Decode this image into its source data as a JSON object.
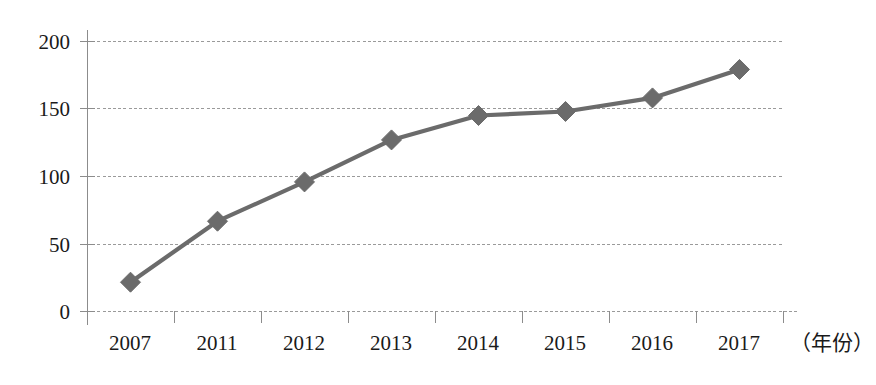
{
  "chart_data": {
    "type": "line",
    "title": "",
    "subtitle": "",
    "xlabel": "（年份）",
    "ylabel": "",
    "categories": [
      "2007",
      "2011",
      "2012",
      "2013",
      "2014",
      "2015",
      "2016",
      "2017"
    ],
    "values": [
      22,
      67,
      96,
      127,
      145,
      148,
      158,
      179
    ],
    "series": [
      {
        "name": "",
        "values": [
          22,
          67,
          96,
          127,
          145,
          148,
          158,
          179
        ]
      }
    ],
    "ylim": [
      0,
      200
    ],
    "yticks": [
      0,
      50,
      100,
      150,
      200
    ],
    "ytick_labels": [
      "0",
      "50",
      "100",
      "150",
      "200"
    ],
    "xtick_labels": [
      "2007",
      "2011",
      "2012",
      "2013",
      "2014",
      "2015",
      "2016",
      "2017"
    ],
    "grid": true,
    "grid_axis": "y",
    "legend": false,
    "legend_position": "none",
    "marker": "diamond",
    "line_color": "#6b6b6b",
    "marker_color": "#6b6b6b",
    "grid_color": "#9a9a9a",
    "axis_color": "#8c8c8c",
    "text_color": "#1a1a1a",
    "background": "#ffffff",
    "annotations": []
  },
  "geometry": {
    "plot_left": 87,
    "plot_right": 783,
    "axis_right_end": 799,
    "y_zero": 312,
    "y_top": 41,
    "band_width": 87
  }
}
